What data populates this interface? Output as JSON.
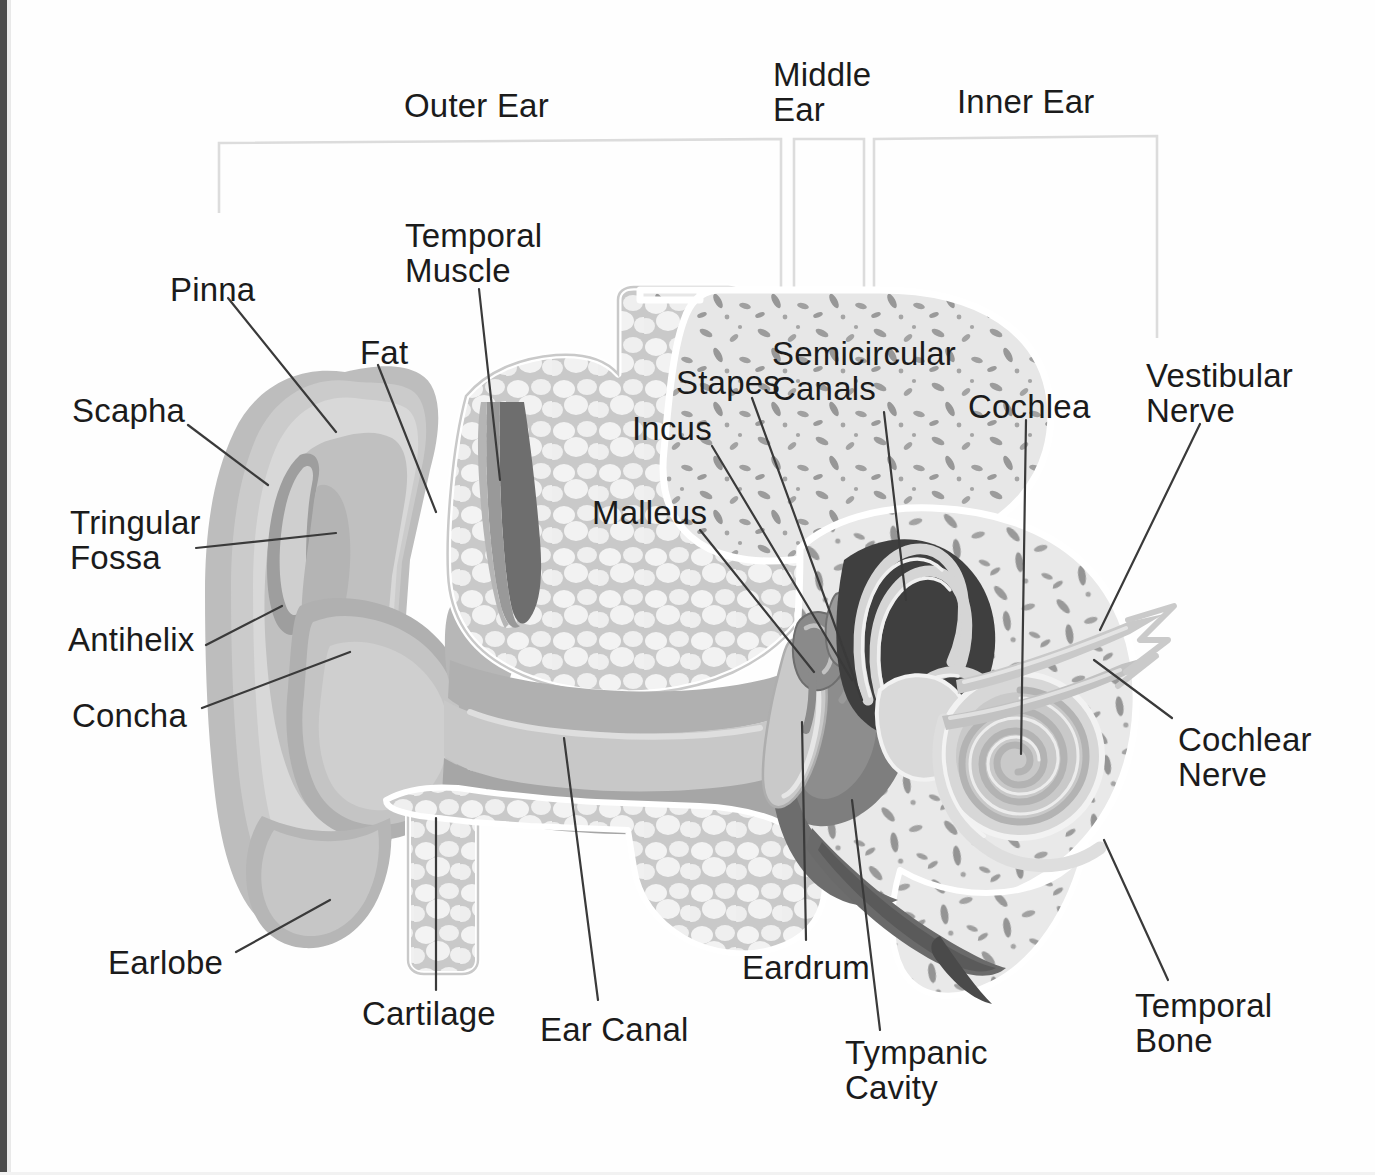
{
  "palette": {
    "background": "#fefefe",
    "ink": "#1b1b1b",
    "leader_line": "#3a3a3a",
    "bracket_line": "#d9d9d9",
    "skin_light": "#cfcfcf",
    "skin_mid": "#bdbdbd",
    "skin_dark": "#a9a9a9",
    "skin_shadow": "#9a9a9a",
    "skin_highlight": "#dcdcdc",
    "fat_fill": "#f0f0f0",
    "fat_cell": "#e8e8e8",
    "fat_outline": "#c6c6c6",
    "bone_fill": "#e6e6e6",
    "bone_speckle": "#9c9c9c",
    "cavity_dark": "#7d7d7d",
    "cavity_darker": "#3d3d3d",
    "muscle_dark": "#6f6f6f",
    "muscle_mid": "#8e8e8e",
    "canal_fill": "#c2c2c2",
    "nerve": "#c8c8c8",
    "scan_edge": "#4a4a4a"
  },
  "sections": {
    "brackets": [
      {
        "id": "outer",
        "label": "Outer Ear"
      },
      {
        "id": "middle",
        "label": "Middle\nEar"
      },
      {
        "id": "inner",
        "label": "Inner Ear"
      }
    ]
  },
  "labels": [
    {
      "id": "outer-ear",
      "text": "Outer Ear",
      "x": 404,
      "y": 88,
      "align": "left",
      "size": "big"
    },
    {
      "id": "middle-ear",
      "text": "Middle\nEar",
      "x": 773,
      "y": 57,
      "align": "left",
      "size": "big"
    },
    {
      "id": "inner-ear",
      "text": "Inner Ear",
      "x": 957,
      "y": 84,
      "align": "left",
      "size": "big"
    },
    {
      "id": "pinna",
      "text": "Pinna",
      "x": 170,
      "y": 272,
      "align": "left",
      "size": "big"
    },
    {
      "id": "temporal-muscle",
      "text": "Temporal\nMuscle",
      "x": 405,
      "y": 218,
      "align": "left",
      "size": "big"
    },
    {
      "id": "fat",
      "text": "Fat",
      "x": 360,
      "y": 335,
      "align": "left",
      "size": "big"
    },
    {
      "id": "scapha",
      "text": "Scapha",
      "x": 72,
      "y": 393,
      "align": "left",
      "size": "big"
    },
    {
      "id": "stapes",
      "text": "Stapes",
      "x": 676,
      "y": 365,
      "align": "left",
      "size": "big"
    },
    {
      "id": "semicircular",
      "text": "Semicircular\nCanals",
      "x": 772,
      "y": 336,
      "align": "left",
      "size": "big"
    },
    {
      "id": "cochlea",
      "text": "Cochlea",
      "x": 968,
      "y": 389,
      "align": "left",
      "size": "big"
    },
    {
      "id": "vestibular-nerve",
      "text": "Vestibular\nNerve",
      "x": 1146,
      "y": 358,
      "align": "left",
      "size": "big"
    },
    {
      "id": "incus",
      "text": "Incus",
      "x": 632,
      "y": 411,
      "align": "left",
      "size": "big"
    },
    {
      "id": "tringular-fossa",
      "text": "Tringular\nFossa",
      "x": 70,
      "y": 505,
      "align": "left",
      "size": "big"
    },
    {
      "id": "malleus",
      "text": "Malleus",
      "x": 592,
      "y": 495,
      "align": "left",
      "size": "big"
    },
    {
      "id": "antihelix",
      "text": "Antihelix",
      "x": 68,
      "y": 622,
      "align": "left",
      "size": "big"
    },
    {
      "id": "concha",
      "text": "Concha",
      "x": 72,
      "y": 698,
      "align": "left",
      "size": "big"
    },
    {
      "id": "cochlear-nerve",
      "text": "Cochlear\nNerve",
      "x": 1178,
      "y": 722,
      "align": "left",
      "size": "big"
    },
    {
      "id": "earlobe",
      "text": "Earlobe",
      "x": 108,
      "y": 945,
      "align": "left",
      "size": "big"
    },
    {
      "id": "eardrum",
      "text": "Eardrum",
      "x": 742,
      "y": 950,
      "align": "left",
      "size": "big"
    },
    {
      "id": "cartilage",
      "text": "Cartilage",
      "x": 362,
      "y": 996,
      "align": "left",
      "size": "big"
    },
    {
      "id": "ear-canal",
      "text": "Ear Canal",
      "x": 540,
      "y": 1012,
      "align": "left",
      "size": "big"
    },
    {
      "id": "temporal-bone",
      "text": "Temporal\nBone",
      "x": 1135,
      "y": 988,
      "align": "left",
      "size": "big"
    },
    {
      "id": "tympanic-cavity",
      "text": "Tympanic\nCavity",
      "x": 845,
      "y": 1035,
      "align": "left",
      "size": "big"
    }
  ],
  "parts": [
    {
      "id": "pinna",
      "name": "Pinna"
    },
    {
      "id": "scapha",
      "name": "Scapha"
    },
    {
      "id": "tringular-fossa",
      "name": "Tringular Fossa"
    },
    {
      "id": "antihelix",
      "name": "Antihelix"
    },
    {
      "id": "concha",
      "name": "Concha"
    },
    {
      "id": "earlobe",
      "name": "Earlobe"
    },
    {
      "id": "cartilage",
      "name": "Cartilage"
    },
    {
      "id": "ear-canal",
      "name": "Ear Canal"
    },
    {
      "id": "fat",
      "name": "Fat"
    },
    {
      "id": "temporal-muscle",
      "name": "Temporal Muscle"
    },
    {
      "id": "temporal-bone",
      "name": "Temporal Bone"
    },
    {
      "id": "eardrum",
      "name": "Eardrum"
    },
    {
      "id": "tympanic-cavity",
      "name": "Tympanic Cavity"
    },
    {
      "id": "malleus",
      "name": "Malleus"
    },
    {
      "id": "incus",
      "name": "Incus"
    },
    {
      "id": "stapes",
      "name": "Stapes"
    },
    {
      "id": "semicircular",
      "name": "Semicircular Canals"
    },
    {
      "id": "cochlea",
      "name": "Cochlea"
    },
    {
      "id": "vestibular-nerve",
      "name": "Vestibular Nerve"
    },
    {
      "id": "cochlear-nerve",
      "name": "Cochlear Nerve"
    }
  ]
}
